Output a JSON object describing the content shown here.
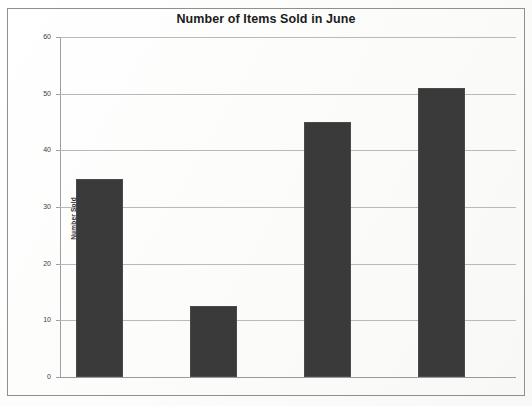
{
  "chart_data": {
    "type": "bar",
    "title": "Number of Items Sold in June",
    "xlabel": "",
    "ylabel": "Number Sold",
    "categories": [
      "Scooters",
      "Bicycles",
      "Skates",
      "Helmets"
    ],
    "values": [
      35,
      12.5,
      45,
      51
    ],
    "ylim": [
      0,
      60
    ],
    "yticks": [
      0,
      10,
      20,
      30,
      40,
      50,
      60
    ],
    "ytick_labels": [
      "0",
      "10",
      "20",
      "30",
      "40",
      "50",
      "60"
    ],
    "grid": true,
    "legend": null,
    "bar_color": "#3a3a3a",
    "gridline_color": "#b9b9b9",
    "background_color": "#fdfdfd",
    "border_color": "#8f8f8f"
  }
}
